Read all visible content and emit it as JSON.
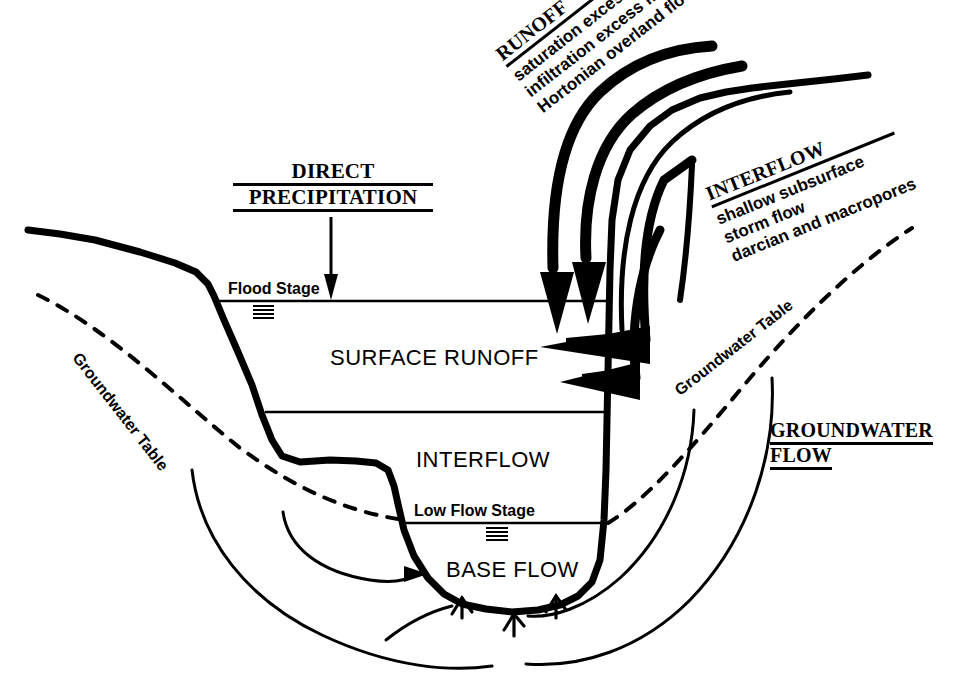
{
  "diagram": {
    "ink_color": "#000000",
    "background": "#ffffff"
  },
  "headings": {
    "direct_precipitation": {
      "line1": "DIRECT",
      "line2": "PRECIPITATION"
    },
    "runoff": {
      "title": "RUNOFF",
      "sub": [
        "saturation excess flow",
        "infiltration excess flow",
        "Hortonian overland flow"
      ]
    },
    "interflow": {
      "title": "INTERFLOW",
      "sub": [
        "shallow subsurface",
        "storm flow",
        "darcian and macropores"
      ]
    },
    "groundwater_flow": {
      "line1": "GROUNDWATER",
      "line2": "FLOW"
    }
  },
  "zones": {
    "surface_runoff": "SURFACE RUNOFF",
    "interflow": "INTERFLOW",
    "base_flow": "BASE FLOW"
  },
  "stage_labels": {
    "flood_stage": "Flood Stage",
    "low_flow_stage": "Low Flow Stage"
  },
  "water_table_labels": {
    "left": "Groundwater Table",
    "right": "Groundwater Table"
  }
}
